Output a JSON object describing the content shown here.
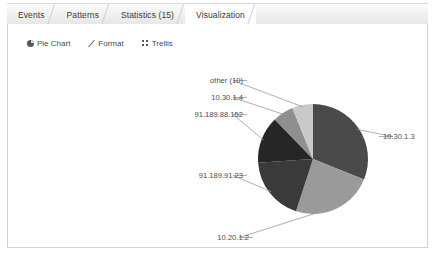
{
  "window": {
    "background": "#ffffff",
    "panel_border": "#d4d4d4"
  },
  "tabs": [
    {
      "label": "Events",
      "name": "tab-events",
      "active": false
    },
    {
      "label": "Patterns",
      "name": "tab-patterns",
      "active": false
    },
    {
      "label": "Statistics (15)",
      "name": "tab-statistics",
      "active": false
    },
    {
      "label": "Visualization",
      "name": "tab-visualization",
      "active": true
    }
  ],
  "toolbar": {
    "items": [
      {
        "label": "Pie Chart",
        "icon": "pie-chart-icon"
      },
      {
        "label": "Format",
        "icon": "pencil-format-icon"
      },
      {
        "label": "Trellis",
        "icon": "trellis-grid-icon"
      }
    ]
  },
  "chart_data": {
    "type": "pie",
    "title": "",
    "xlabel": "",
    "ylabel": "",
    "legend_position": "callout-labels",
    "grid": false,
    "categories": [
      "10.30.1.3",
      "10.20.1.2",
      "91.189.91.23",
      "91.189.88.152",
      "10.30.1.4",
      "other (10)"
    ],
    "values": [
      31,
      24,
      19,
      14,
      6,
      6
    ],
    "colors": [
      "#4a4a4a",
      "#9a9a9a",
      "#3a3a3a",
      "#262626",
      "#8f8f8f",
      "#c9c9c9"
    ],
    "slices": [
      {
        "label": "10.30.1.3",
        "value": 31,
        "color": "#4a4a4a",
        "start_deg": 0,
        "end_deg": 112
      },
      {
        "label": "10.20.1.2",
        "value": 24,
        "color": "#9a9a9a",
        "start_deg": 112,
        "end_deg": 198
      },
      {
        "label": "91.189.91.23",
        "value": 19,
        "color": "#3a3a3a",
        "start_deg": 198,
        "end_deg": 266
      },
      {
        "label": "91.189.88.152",
        "value": 14,
        "color": "#262626",
        "start_deg": 266,
        "end_deg": 316
      },
      {
        "label": "10.30.1.4",
        "value": 6,
        "color": "#8f8f8f",
        "start_deg": 316,
        "end_deg": 338
      },
      {
        "label": "other (10)",
        "value": 6,
        "color": "#c9c9c9",
        "start_deg": 338,
        "end_deg": 360
      }
    ],
    "center": {
      "x": 313,
      "y": 160
    },
    "radius": 55,
    "callouts": [
      {
        "label": "other (10)",
        "text_x": 243,
        "text_y": 84,
        "anchor": "end"
      },
      {
        "label": "10.30.1.4",
        "text_x": 243,
        "text_y": 101,
        "anchor": "end"
      },
      {
        "label": "91.189.88.152",
        "text_x": 243,
        "text_y": 118,
        "anchor": "end"
      },
      {
        "label": "91.189.91.23",
        "text_x": 243,
        "text_y": 179,
        "anchor": "end"
      },
      {
        "label": "10.20.1.2",
        "text_x": 249,
        "text_y": 241,
        "anchor": "end"
      },
      {
        "label": "10.30.1.3",
        "text_x": 383,
        "text_y": 140,
        "anchor": "start"
      }
    ]
  }
}
